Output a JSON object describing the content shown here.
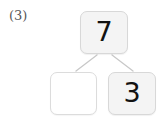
{
  "item": {
    "label": "(3)"
  },
  "diagram": {
    "type": "number-bond",
    "whole": {
      "value": "7",
      "filled": true
    },
    "parts": [
      {
        "position": "bottom-left",
        "value": "",
        "filled": false
      },
      {
        "position": "bottom-right",
        "value": "3",
        "filled": true
      }
    ],
    "connectors": [
      {
        "from": "whole",
        "to": "bottom-left"
      },
      {
        "from": "whole",
        "to": "bottom-right"
      }
    ]
  },
  "colors": {
    "background": "#ffffff",
    "box_fill": "#f4f4f4",
    "box_border": "#d8d8d8",
    "empty_box_fill": "#ffffff",
    "digit": "#121212",
    "label": "#555555",
    "connector": "#c8c8c8"
  }
}
